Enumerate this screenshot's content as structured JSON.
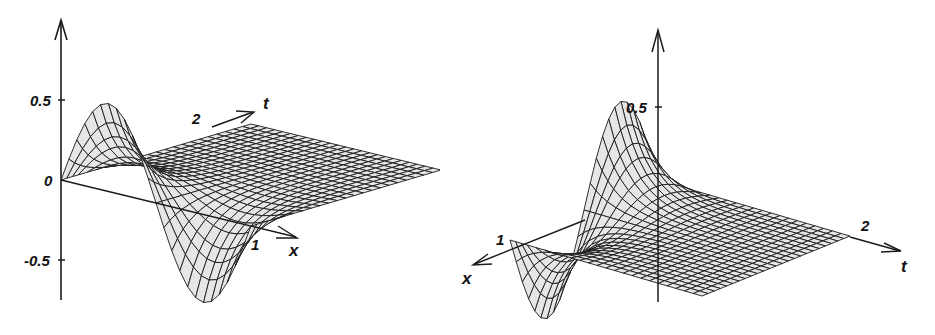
{
  "chart_data": [
    {
      "type": "surface3d",
      "title": "",
      "description": "Wireframe surface u(x,t): single sine period in x at t=0 decaying in t; view from front-left",
      "axes": {
        "vertical": {
          "ticks": [
            "0.5",
            "0",
            "-0.5"
          ],
          "range": [
            -0.75,
            0.95
          ]
        },
        "x": {
          "label": "x",
          "ticks": [
            "1"
          ],
          "range": [
            0,
            1
          ]
        },
        "t": {
          "label": "t",
          "ticks": [
            "2"
          ],
          "range": [
            0,
            2
          ]
        }
      },
      "surface": {
        "initial_profile": "0.45*sin(2*pi*x)",
        "decay": "exponential in t",
        "peak": 0.45,
        "trough": -0.7
      },
      "grid": false
    },
    {
      "type": "surface3d",
      "title": "",
      "description": "Same surface viewed from a rotated angle (x axis pointing front-left, t axis to the right)",
      "axes": {
        "vertical": {
          "ticks": [
            "0.5"
          ],
          "range": [
            -0.4,
            0.95
          ]
        },
        "x": {
          "label": "x",
          "ticks": [
            "1"
          ],
          "range": [
            0,
            1
          ]
        },
        "t": {
          "label": "t",
          "ticks": [
            "2"
          ],
          "range": [
            0,
            2
          ]
        }
      },
      "surface": {
        "initial_profile": "0.45*sin(2*pi*x)",
        "decay": "exponential in t",
        "peak": 0.45,
        "trough": -0.35
      },
      "grid": false
    }
  ],
  "plots": {
    "left": {
      "tick_05": "0.5",
      "tick_0": "0",
      "tick_m05": "-0.5",
      "x_tick": "1",
      "x_label": "x",
      "t_tick": "2",
      "t_label": "t"
    },
    "right": {
      "tick_05": "0.5",
      "x_tick": "1",
      "x_label": "x",
      "t_tick": "2",
      "t_label": "t"
    }
  },
  "colors": {
    "line": "#1a1a1a",
    "fill": "#e6e6e6",
    "background": "#ffffff"
  }
}
